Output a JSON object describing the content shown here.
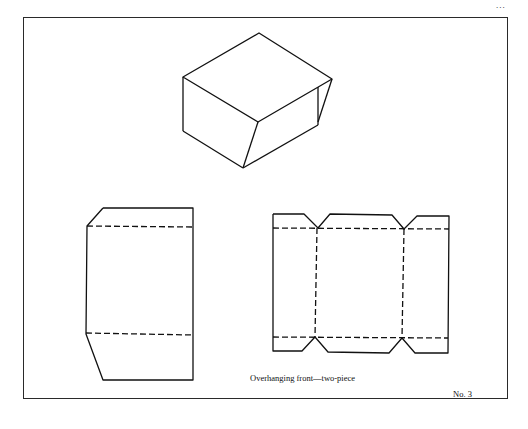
{
  "page": {
    "page_number_fragment": "...",
    "caption": "Overhanging front—two-piece",
    "plate_number": "No. 3"
  },
  "figures": [
    {
      "id": "assembled-box",
      "description": "Isometric view of assembled box with overhanging front"
    },
    {
      "id": "lid-net",
      "description": "Flat net of front/lid piece with fold lines"
    },
    {
      "id": "body-net",
      "description": "Flat net of body piece with tabs and fold lines"
    }
  ],
  "style": {
    "line_color": "#111111",
    "frame_color": "#2a2a2a",
    "background": "#ffffff"
  }
}
